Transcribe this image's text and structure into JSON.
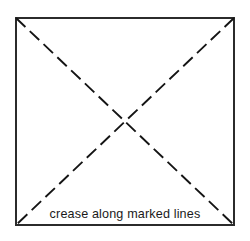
{
  "figure": {
    "name": "paper-folding-crease-diagram",
    "background_color": "#ffffff",
    "sheet": {
      "name": "square-sheet",
      "x": 16,
      "y": 18,
      "width": 218,
      "height": 207,
      "stroke_color": "#2b2b2b",
      "stroke_width": 1.5,
      "fill_color": "#ffffff"
    },
    "creases": [
      {
        "name": "crease-diagonal-top-left-to-bottom-right",
        "x1": 16,
        "y1": 18,
        "x2": 234,
        "y2": 225,
        "style": "dashed",
        "stroke_color": "#141414",
        "stroke_width": 1.9,
        "dash_length": 13,
        "gap_length": 6
      },
      {
        "name": "crease-diagonal-top-right-to-bottom-left",
        "x1": 234,
        "y1": 18,
        "x2": 16,
        "y2": 225,
        "style": "dashed",
        "stroke_color": "#141414",
        "stroke_width": 1.9,
        "dash_length": 13,
        "gap_length": 6
      }
    ],
    "intersection": {
      "name": "crease-intersection-point",
      "x": 125,
      "y": 121.5
    },
    "caption": {
      "text": "crease along marked lines",
      "x": 125,
      "y": 218,
      "anchor": "middle",
      "color": "#1a1a1a",
      "font_size": 12.6
    }
  }
}
